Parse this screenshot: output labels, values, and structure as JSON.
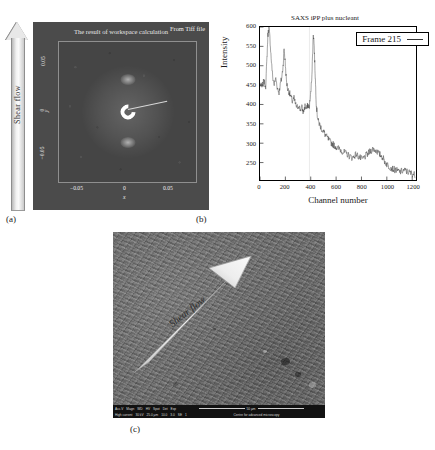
{
  "figure": {
    "panels": [
      {
        "id": "a",
        "caption": "(a)"
      },
      {
        "id": "b",
        "caption": "(b)"
      },
      {
        "id": "c",
        "caption": "(c)"
      }
    ]
  },
  "panel_a": {
    "title": "The result of workspace calculation",
    "source_note": "From Tiff file",
    "shear_arrow_label": "Shear flow",
    "xlabel": "x",
    "ylabel": "y",
    "xticks": [
      "−0.05",
      "0",
      "0.05"
    ],
    "yticks": [
      "0.05",
      "0",
      "−0.05"
    ],
    "image_type": "2D SAXS scattering pattern",
    "features": {
      "beamstop": "C-shaped bright beamstop at center",
      "lobes": "two diffuse meridional lobes above and below centre",
      "arm": "thin diagonal beamstop arm"
    },
    "colors": {
      "background": "#4b4b4b",
      "plot_area": "#454545",
      "text": "#ededed",
      "frame": "#8f8f8f"
    }
  },
  "chart_data": {
    "type": "line",
    "title": "SAXS iPP plus nucleant",
    "xlabel": "Channel number",
    "ylabel": "Intensity",
    "xlim": [
      0,
      1230
    ],
    "ylim": [
      205,
      600
    ],
    "xticks": [
      0,
      200,
      400,
      600,
      800,
      1000,
      1200
    ],
    "yticks": [
      250,
      300,
      350,
      400,
      450,
      500,
      550,
      600
    ],
    "grid": false,
    "legend": {
      "position": "top-right",
      "entries": [
        {
          "name": "Frame 215",
          "color": "#333333"
        }
      ]
    },
    "series": [
      {
        "name": "Frame 215",
        "color": "#333333",
        "x": [
          0,
          15,
          30,
          45,
          55,
          62,
          70,
          78,
          88,
          100,
          112,
          125,
          138,
          150,
          162,
          172,
          182,
          190,
          198,
          208,
          218,
          230,
          242,
          255,
          268,
          280,
          292,
          305,
          318,
          330,
          342,
          355,
          368,
          378,
          388,
          398,
          408,
          415,
          420,
          426,
          432,
          438,
          444,
          452,
          460,
          470,
          482,
          495,
          508,
          520,
          535,
          550,
          565,
          580,
          595,
          610,
          625,
          640,
          655,
          670,
          685,
          700,
          715,
          730,
          745,
          760,
          775,
          790,
          805,
          820,
          835,
          850,
          865,
          880,
          895,
          910,
          925,
          940,
          955,
          970,
          985,
          1000,
          1015,
          1030,
          1045,
          1060,
          1075,
          1090,
          1105,
          1120,
          1135,
          1150,
          1165,
          1180,
          1195,
          1210,
          1225
        ],
        "y": [
          452,
          444,
          460,
          448,
          520,
          578,
          600,
          572,
          520,
          470,
          452,
          468,
          441,
          432,
          455,
          470,
          500,
          545,
          512,
          462,
          440,
          432,
          420,
          408,
          416,
          400,
          392,
          398,
          386,
          392,
          380,
          396,
          388,
          400,
          392,
          420,
          470,
          530,
          585,
          560,
          505,
          452,
          400,
          372,
          356,
          348,
          340,
          332,
          326,
          318,
          312,
          305,
          300,
          296,
          292,
          288,
          285,
          282,
          278,
          275,
          272,
          268,
          265,
          262,
          268,
          272,
          266,
          262,
          258,
          262,
          268,
          272,
          278,
          282,
          286,
          282,
          278,
          272,
          268,
          262,
          252,
          246,
          240,
          238,
          234,
          232,
          230,
          228,
          226,
          228,
          230,
          228,
          226,
          224,
          222,
          220,
          218
        ]
      }
    ]
  },
  "panel_c": {
    "shear_arrow_label": "Shear flow",
    "image_type": "SEM micrograph of sheared surface",
    "info_bar": {
      "row1": [
        "Acc.V",
        "Magn",
        "WD",
        "HV",
        "Spot",
        "Det",
        "Exp"
      ],
      "row2": [
        "High current",
        "30 kV",
        "25.0 µm",
        "10.0",
        "3.0",
        "SE",
        "1"
      ],
      "scale_label": "50 µm",
      "footer": "Centre for advanced microscopy"
    }
  }
}
